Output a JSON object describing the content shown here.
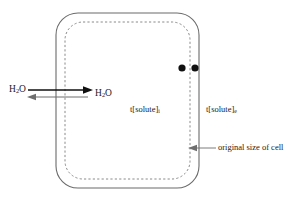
{
  "diagram": {
    "background_color": "#ffffff",
    "line_color": "#555555",
    "ink_color": "#1a1a1a",
    "labels": {
      "water_outside": "H",
      "water_outside_sub": "2",
      "water_outside_tail": "O",
      "water_inside": "H",
      "water_inside_sub": "2",
      "water_inside_tail": "O",
      "solute_inside": "t[solute]",
      "solute_inside_sub": "i",
      "solute_outside": "t[solute]",
      "solute_outside_sub": "e",
      "original_size_note": "original size of cell"
    },
    "shapes": {
      "outer_cell": "solid rounded rectangle (original cell membrane)",
      "inner_cell": "dashed rounded rectangle (shrunken cell)",
      "marker_dots": 2
    },
    "arrows": {
      "water_out": "long right-pointing arrow (water leaving cell)",
      "water_in": "short left-pointing arrow (water entering cell)",
      "callout": "left-pointing leader arrow to original membrane"
    }
  }
}
